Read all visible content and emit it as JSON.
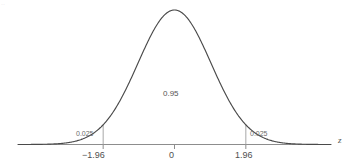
{
  "figure": {
    "background_color": "#ffffff",
    "width": 351,
    "height": 166,
    "corner_mark": "··"
  },
  "chart_data": {
    "type": "line",
    "title": "",
    "subtitle": "",
    "xlabel": "z",
    "ylabel": "",
    "grid": false,
    "legend": null,
    "distribution": "standard normal",
    "mean": 0,
    "sd": 1,
    "xlim": [
      -4.3,
      4.3
    ],
    "ylim": [
      0,
      0.43
    ],
    "x": [
      -4.3,
      -4.0,
      -3.5,
      -3.0,
      -2.5,
      -2.0,
      -1.96,
      -1.5,
      -1.0,
      -0.5,
      0.0,
      0.5,
      1.0,
      1.5,
      1.96,
      2.0,
      2.5,
      3.0,
      3.5,
      4.0,
      4.3
    ],
    "values": [
      0.0001,
      0.0001,
      0.0009,
      0.0044,
      0.0175,
      0.054,
      0.0584,
      0.1295,
      0.242,
      0.3521,
      0.3989,
      0.3521,
      0.242,
      0.1295,
      0.0584,
      0.054,
      0.0175,
      0.0044,
      0.0009,
      0.0001,
      0.0001
    ],
    "xticks": [
      -1.96,
      0,
      1.96
    ],
    "xticklabels": [
      "−1.96",
      "0",
      "1.96"
    ],
    "yticks": [],
    "yticklabels": [],
    "boundaries": [
      -1.96,
      1.96
    ],
    "regions": [
      {
        "name": "left-tail",
        "label": "0.025",
        "value": 0.025,
        "from": -4.3,
        "to": -1.96
      },
      {
        "name": "central",
        "label": "0.95",
        "value": 0.95,
        "from": -1.96,
        "to": 1.96
      },
      {
        "name": "right-tail",
        "label": "0.025",
        "value": 0.025,
        "from": 1.96,
        "to": 4.3
      }
    ],
    "annotations": [
      {
        "name": "left-tail-area",
        "text": "0.025"
      },
      {
        "name": "central-area",
        "text": "0.95"
      },
      {
        "name": "right-tail-area",
        "text": "0.025"
      }
    ],
    "colors": {
      "curve": "#4a4a4a",
      "axis": "#8d8d8d",
      "boundary_line": "#a8a8a8",
      "text": "#555555",
      "background": "#ffffff"
    }
  },
  "labels": {
    "left_tail_area": "0.025",
    "central_area": "0.95",
    "right_tail_area": "0.025",
    "tick_minus": "−1.96",
    "tick_zero": "0",
    "tick_plus": "1.96",
    "axis_name": "z"
  }
}
